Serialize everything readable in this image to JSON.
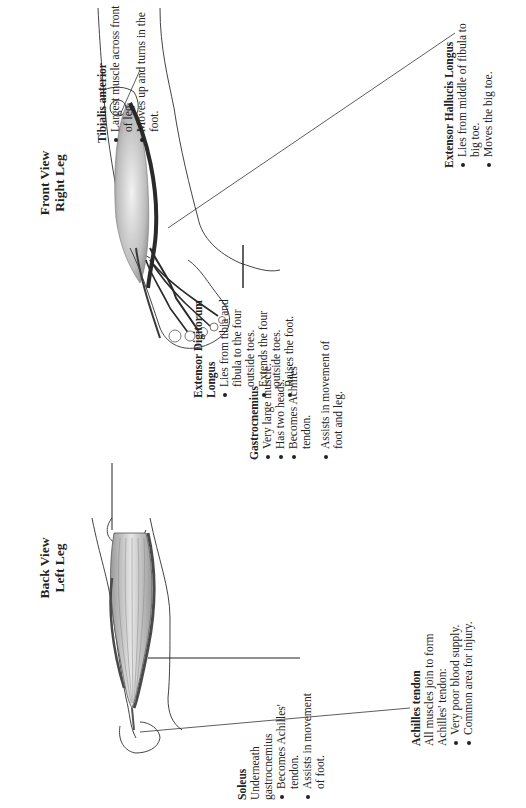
{
  "views": {
    "front": {
      "title_line1": "Front View",
      "title_line2": "Right Leg"
    },
    "back": {
      "title_line1": "Back View",
      "title_line2": "Left Leg"
    }
  },
  "muscles": {
    "tibialis_anterior": {
      "name": "Tibialis anterior",
      "bullets": [
        "Largest muscle across front of leg.",
        "Moves up and turns in the foot."
      ]
    },
    "extensor_hallucis_longus": {
      "name": "Extensor Hallucis Longus",
      "bullets": [
        "Lies from middle of fibula to big toe.",
        "Moves the big toe."
      ]
    },
    "extensor_digitorum_longus": {
      "name": "Extensor Digitorum Longus",
      "bullets": [
        "Lies from tibia and fibula to the four outside toes.",
        "Extends the four outside toes.",
        "Raises the foot."
      ]
    },
    "gastrocnemius": {
      "name": "Gastrocnemius",
      "bullets": [
        "Very large muscle.",
        "Has two heads.",
        "Becomes Achilles' tendon.",
        "Assists in movement of foot and leg."
      ]
    },
    "soleus": {
      "name": "Soleus",
      "description": "Underneath gastrocnemius",
      "bullets": [
        "Becomes Achilles' tendon.",
        "Assists in movement of foot."
      ]
    },
    "achilles_tendon": {
      "name": "Achilles tendon",
      "description": "All muscles join to form Achilles' tendon:",
      "bullets": [
        "Very poor blood supply.",
        "Common area for injury."
      ]
    }
  },
  "colors": {
    "outline": "#444444",
    "muscle_light": "#d9d9d9",
    "muscle_mid": "#a8a8a8",
    "muscle_dark": "#3a3a3a",
    "text": "#222222"
  }
}
